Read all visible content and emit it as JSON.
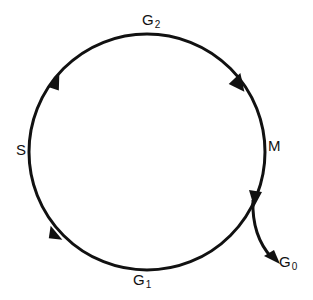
{
  "diagram": {
    "stroke_color": "#111111",
    "phases": [
      {
        "id": "G2",
        "main": "G",
        "sub": "2"
      },
      {
        "id": "M",
        "main": "M",
        "sub": ""
      },
      {
        "id": "G1",
        "main": "G",
        "sub": "1"
      },
      {
        "id": "S",
        "main": "S",
        "sub": ""
      },
      {
        "id": "G0",
        "main": "G",
        "sub": "0"
      }
    ],
    "direction": "clockwise",
    "exit_branch": {
      "from": "M/G1",
      "to": "G0"
    }
  }
}
